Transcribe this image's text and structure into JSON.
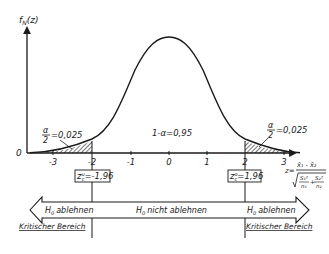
{
  "diagram": {
    "y_axis_label": "f",
    "y_axis_label_sub": "N",
    "y_axis_label_arg": "(z)",
    "origin_label": "0",
    "x_ticks": [
      "-3",
      "-2",
      "-1",
      "0",
      "1",
      "2",
      "3"
    ],
    "center_label": "1-α=0,95",
    "left_tail": {
      "alpha_num": "α",
      "alpha_den": "2",
      "value": "=0,025"
    },
    "right_tail": {
      "alpha_num": "α",
      "alpha_den": "2",
      "value": "=0,025"
    },
    "left_critical": {
      "symbol": "z",
      "sup": "u",
      "sub": "c",
      "value": "=-1,96"
    },
    "right_critical": {
      "symbol": "z",
      "sup": "o",
      "sub": "c",
      "value": "=1,96"
    },
    "z_formula": {
      "lhs": "z=",
      "numerator": "x̄₁ - x̄₂",
      "den_term1_num": "S₁²",
      "den_term1_den": "n₁",
      "den_plus": "+",
      "den_term2_num": "S₂²",
      "den_term2_den": "n₂"
    },
    "regions": {
      "left": {
        "h": "H",
        "h_sub": "0",
        "text": "ablehnen",
        "caption": "Kritischer Bereich"
      },
      "middle": {
        "h": "H",
        "h_sub": "0",
        "text": "nicht ablehnen"
      },
      "right": {
        "h": "H",
        "h_sub": "0",
        "text": "ablehnen",
        "caption": "Kritischer Bereich"
      }
    },
    "colors": {
      "ink": "#1a1a1a",
      "background": "#ffffff"
    }
  }
}
